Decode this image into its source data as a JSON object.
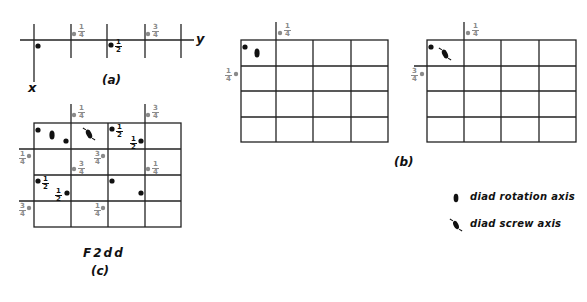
{
  "figure_a": {
    "caption": "(a)",
    "axis_x_label": "x",
    "axis_y_label": "y",
    "points": [
      {
        "kind": "black",
        "x": 38,
        "y": 47,
        "label": null
      },
      {
        "kind": "grey",
        "x": 74,
        "y": 34,
        "label": {
          "n": "1",
          "d": "4"
        }
      },
      {
        "kind": "black",
        "x": 111,
        "y": 46,
        "label": {
          "n": "1",
          "d": "2"
        }
      },
      {
        "kind": "grey",
        "x": 148,
        "y": 34,
        "label": {
          "n": "3",
          "d": "4"
        }
      }
    ]
  },
  "figure_b": {
    "caption": "(b)",
    "left": {
      "top_label": {
        "n": "1",
        "d": "4"
      },
      "side_label": {
        "n": "1",
        "d": "4"
      },
      "symbol": "diad-rotation-axis"
    },
    "right": {
      "top_label": {
        "n": "1",
        "d": "4"
      },
      "side_label": {
        "n": "3",
        "d": "4"
      },
      "symbol": "diad-screw-axis"
    }
  },
  "figure_c": {
    "title": "F2dd",
    "caption": "(c)",
    "fractions": {
      "top_1": {
        "n": "1",
        "d": "4"
      },
      "top_2": {
        "n": "3",
        "d": "4"
      },
      "left_1": {
        "n": "1",
        "d": "4"
      },
      "left_2": {
        "n": "3",
        "d": "4"
      },
      "mid_1": {
        "n": "3",
        "d": "4"
      },
      "mid_2": {
        "n": "3",
        "d": "4"
      },
      "mid_3": {
        "n": "1",
        "d": "4"
      },
      "bot_1": {
        "n": "1",
        "d": "4"
      },
      "half_1": {
        "n": "1",
        "d": "2"
      },
      "half_2": {
        "n": "1",
        "d": "2"
      },
      "half_3": {
        "n": "1",
        "d": "2"
      },
      "half_4": {
        "n": "1",
        "d": "2"
      }
    }
  },
  "legend": {
    "items": [
      {
        "symbol": "diad-rotation-axis",
        "label": "diad rotation axis"
      },
      {
        "symbol": "diad-screw-axis",
        "label": "diad screw axis"
      }
    ]
  },
  "colors": {
    "line": "#222222",
    "black_point": "#111111",
    "grey_point": "#8a8a8a"
  }
}
